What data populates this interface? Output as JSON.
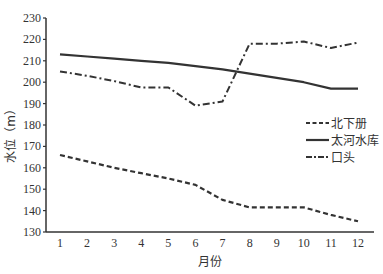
{
  "chart_data": {
    "type": "line",
    "title": "",
    "xlabel": "月份",
    "ylabel": "水位（m）",
    "categories": [
      "1",
      "2",
      "3",
      "4",
      "5",
      "6",
      "7",
      "8",
      "9",
      "10",
      "11",
      "12"
    ],
    "yticks": [
      "130",
      "140",
      "150",
      "160",
      "170",
      "180",
      "190",
      "200",
      "210",
      "220",
      "230"
    ],
    "ylim": [
      130,
      230
    ],
    "grid": false,
    "legend_position": "right-middle inside",
    "series": [
      {
        "name": "北下册",
        "style": "dashed",
        "values": [
          166,
          163,
          160,
          157.5,
          155,
          152,
          145,
          141.5,
          141.5,
          141.5,
          138,
          135
        ]
      },
      {
        "name": "太河水库",
        "style": "solid",
        "values": [
          213,
          212,
          211,
          210,
          209,
          207.5,
          206,
          204,
          202,
          200,
          197,
          197
        ]
      },
      {
        "name": "口头",
        "style": "dash-dot",
        "values": [
          205,
          203,
          200.5,
          197.5,
          197.5,
          189,
          191,
          218,
          218,
          219,
          216,
          218.5
        ]
      }
    ]
  }
}
